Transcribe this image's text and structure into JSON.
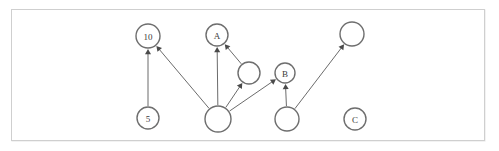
{
  "figure": {
    "title": "",
    "frame": {
      "x": 11,
      "y": 9,
      "width": 474,
      "height": 132,
      "border_color": "#cfcfcf",
      "background": "#ffffff"
    },
    "canvas": {
      "width": 499,
      "height": 151
    }
  },
  "graph": {
    "type": "directed-graph",
    "node_fill": "#ffffff",
    "node_stroke": "#6e6e6e",
    "edge_color": "#5a5a5a",
    "label_color": "#3a3a3a",
    "nodes": [
      {
        "id": "n10",
        "label": "10",
        "cx": 148,
        "cy": 36,
        "r": 12
      },
      {
        "id": "n5",
        "label": "5",
        "cx": 148,
        "cy": 118,
        "r": 11
      },
      {
        "id": "nA",
        "label": "A",
        "cx": 217,
        "cy": 35,
        "r": 11
      },
      {
        "id": "nMid",
        "label": "",
        "cx": 249,
        "cy": 73,
        "r": 11
      },
      {
        "id": "nB",
        "label": "B",
        "cx": 285,
        "cy": 73,
        "r": 10
      },
      {
        "id": "nHub",
        "label": "",
        "cx": 218,
        "cy": 119,
        "r": 13
      },
      {
        "id": "nLow",
        "label": "",
        "cx": 287,
        "cy": 119,
        "r": 12
      },
      {
        "id": "nTop",
        "label": "",
        "cx": 352,
        "cy": 34,
        "r": 12
      },
      {
        "id": "nC",
        "label": "C",
        "cx": 355,
        "cy": 119,
        "r": 11
      }
    ],
    "edges": [
      {
        "from": "n5",
        "to": "n10",
        "directed": true
      },
      {
        "from": "nHub",
        "to": "n10",
        "directed": true
      },
      {
        "from": "nHub",
        "to": "nA",
        "directed": true
      },
      {
        "from": "nMid",
        "to": "nA",
        "directed": true
      },
      {
        "from": "nHub",
        "to": "nMid",
        "directed": true
      },
      {
        "from": "nHub",
        "to": "nB",
        "directed": true
      },
      {
        "from": "nLow",
        "to": "nB",
        "directed": true
      },
      {
        "from": "nLow",
        "to": "nTop",
        "directed": true
      }
    ]
  }
}
